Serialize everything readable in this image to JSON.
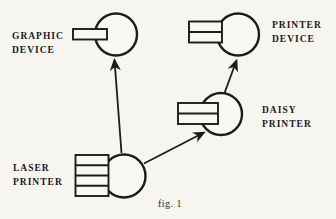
{
  "figure": {
    "caption": "fig. 1",
    "type": "network-diagram"
  },
  "colors": {
    "ink": "#1c1c1c",
    "paper": "#f7f5f0",
    "shape_fill": "#f9f8f4"
  },
  "nodes": {
    "graphic_device": {
      "label_line1": "GRAPHIC",
      "label_line2": "DEVICE",
      "ports": 1
    },
    "printer_device": {
      "label_line1": "PRINTER",
      "label_line2": "DEVICE",
      "ports": 2
    },
    "daisy_printer": {
      "label_line1": "DAISY",
      "label_line2": "PRINTER",
      "ports": 2
    },
    "laser_printer": {
      "label_line1": "LASER",
      "label_line2": "PRINTER",
      "ports": 4
    }
  },
  "edges": [
    {
      "from": "laser_printer",
      "to": "graphic_device"
    },
    {
      "from": "laser_printer",
      "to": "daisy_printer"
    },
    {
      "from": "daisy_printer",
      "to": "printer_device"
    }
  ]
}
